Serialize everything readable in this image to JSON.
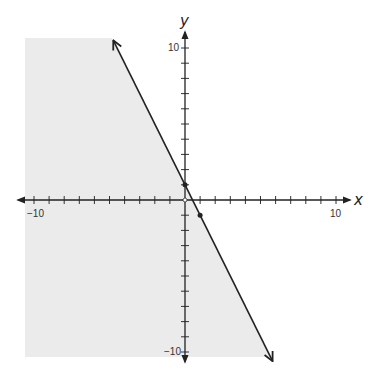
{
  "chart_data": {
    "type": "line",
    "title": "",
    "xlabel": "x",
    "ylabel": "y",
    "xlim": [
      -10,
      10
    ],
    "ylim": [
      -10,
      10
    ],
    "grid": false,
    "tick_step": 1,
    "tick_labels": {
      "x": [
        {
          "value": -10,
          "label": "−10"
        },
        {
          "value": 10,
          "label": "10"
        }
      ],
      "y": [
        {
          "value": 10,
          "label": "10"
        },
        {
          "value": -10,
          "label": "−10"
        }
      ]
    },
    "series": [
      {
        "name": "boundary line",
        "equation": "y = -2x + 1",
        "slope": -2,
        "intercept": 1,
        "style": "solid",
        "x": [
          -4.75,
          5.8
        ],
        "y": [
          10.5,
          -10.6
        ],
        "marked_points": [
          [
            0,
            1
          ],
          [
            1,
            -1
          ]
        ]
      }
    ],
    "shaded_region": {
      "description": "y <= -2x + 1 (left/below the line)",
      "color": "#ebebeb"
    }
  },
  "labels": {
    "x_axis": "x",
    "y_axis": "y",
    "x_min": "−10",
    "x_max": "10",
    "y_max": "10",
    "y_min": "−10"
  },
  "colors": {
    "shade": "#ebebeb",
    "axis": "#222222",
    "line": "#222222"
  }
}
